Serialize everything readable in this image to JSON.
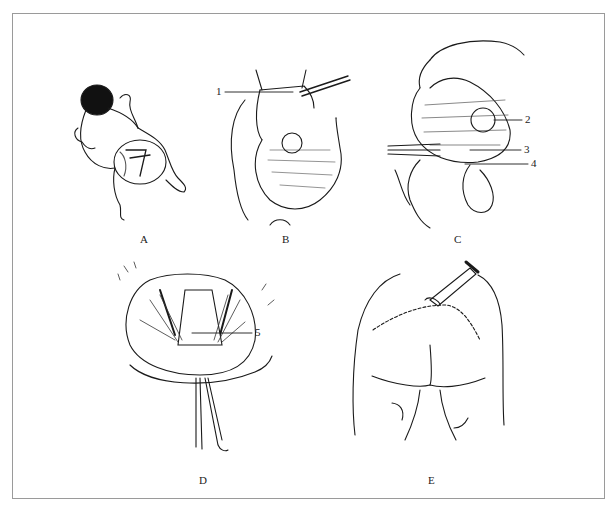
{
  "figure": {
    "panels": [
      {
        "id": "A",
        "label": "A",
        "subject": "infant-prone-lumbosacral-mass"
      },
      {
        "id": "B",
        "label": "B",
        "subject": "mass-exposure-with-retractors"
      },
      {
        "id": "C",
        "label": "C",
        "subject": "mass-dissection-with-hand"
      },
      {
        "id": "D",
        "label": "D",
        "subject": "surgical-field-closure-layers"
      },
      {
        "id": "E",
        "label": "E",
        "subject": "sutured-incision-with-drain"
      }
    ],
    "callouts": [
      "1",
      "2",
      "3",
      "4",
      "5"
    ]
  }
}
